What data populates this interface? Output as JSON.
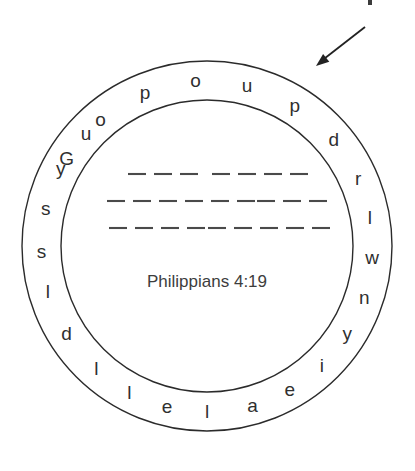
{
  "canvas": {
    "width": 415,
    "height": 471,
    "background": "#ffffff",
    "ink": "#2b2b2b"
  },
  "puzzle": {
    "type": "word-circle-anagram",
    "title": "Philippians 4:19",
    "outer_circle": {
      "center_x": 207,
      "center_y": 246,
      "radius": 185,
      "stroke": "#2b2b2b"
    },
    "inner_circle": {
      "center_x": 207,
      "center_y": 246,
      "radius": 146,
      "stroke": "#2b2b2b"
    },
    "letters": [
      {
        "char": "G",
        "angle": -58
      },
      {
        "char": "o",
        "angle": -40
      },
      {
        "char": "p",
        "angle": -22
      },
      {
        "char": "o",
        "angle": -4
      },
      {
        "char": "u",
        "angle": 14
      },
      {
        "char": "p",
        "angle": 32
      },
      {
        "char": "d",
        "angle": 50
      },
      {
        "char": "r",
        "angle": 66
      },
      {
        "char": "l",
        "angle": 80
      },
      {
        "char": "w",
        "angle": 94
      },
      {
        "char": "n",
        "angle": 108
      },
      {
        "char": "y",
        "angle": 122
      },
      {
        "char": "i",
        "angle": 136
      },
      {
        "char": "e",
        "angle": 150
      },
      {
        "char": "a",
        "angle": 164
      },
      {
        "char": "l",
        "angle": 180
      },
      {
        "char": "e",
        "angle": 194
      },
      {
        "char": "l",
        "angle": 208
      },
      {
        "char": "l",
        "angle": 222
      },
      {
        "char": "d",
        "angle": 238
      },
      {
        "char": "l",
        "angle": 254
      },
      {
        "char": "s",
        "angle": 268
      },
      {
        "char": "s",
        "angle": 283
      },
      {
        "char": "y",
        "angle": 298
      },
      {
        "char": "u",
        "angle": 313
      }
    ],
    "letter_sequence": "GopoupdrlwnyiealelldlssyuXX",
    "answer_lines": [
      {
        "row": 1,
        "y": 174,
        "groups": [
          {
            "dashes": 3,
            "start_x": 128
          },
          {
            "dashes": 4,
            "start_x": 212
          }
        ]
      },
      {
        "row": 2,
        "y": 201,
        "groups": [
          {
            "dashes": 6,
            "start_x": 107
          },
          {
            "dashes": 3,
            "start_x": 257
          }
        ]
      },
      {
        "row": 3,
        "y": 228,
        "groups": [
          {
            "dashes": 4,
            "start_x": 109
          },
          {
            "dashes": 5,
            "start_x": 208
          }
        ]
      }
    ],
    "dash_metrics": {
      "dash_length": 18,
      "dash_gap": 8
    }
  },
  "annotation": {
    "arrow": {
      "name": "pointer-arrow",
      "from_x": 365,
      "from_y": 27,
      "to_x": 316,
      "to_y": 66,
      "points_to": "outer-ring"
    },
    "crop_mark": {
      "x": 368,
      "y": 0,
      "width": 4,
      "height": 5
    }
  }
}
